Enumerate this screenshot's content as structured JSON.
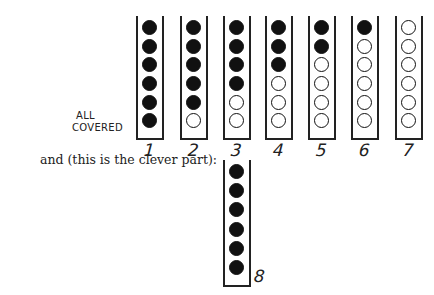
{
  "figure": {
    "annotation": [
      "ALL",
      "COVERED"
    ],
    "caption": "and (this is the clever part):",
    "columns": [
      {
        "label": "1",
        "holes": [
          "filled",
          "filled",
          "filled",
          "filled",
          "filled",
          "filled"
        ]
      },
      {
        "label": "2",
        "holes": [
          "filled",
          "filled",
          "filled",
          "filled",
          "filled",
          "empty"
        ]
      },
      {
        "label": "3",
        "holes": [
          "filled",
          "filled",
          "filled",
          "filled",
          "empty",
          "empty"
        ]
      },
      {
        "label": "4",
        "holes": [
          "filled",
          "filled",
          "filled",
          "empty",
          "empty",
          "empty"
        ]
      },
      {
        "label": "5",
        "holes": [
          "filled",
          "filled",
          "empty",
          "empty",
          "empty",
          "empty"
        ]
      },
      {
        "label": "6",
        "holes": [
          "filled",
          "empty",
          "empty",
          "empty",
          "empty",
          "empty"
        ]
      },
      {
        "label": "7",
        "holes": [
          "empty",
          "empty",
          "empty",
          "empty",
          "empty",
          "empty"
        ]
      }
    ],
    "extra_column": {
      "label": "8",
      "holes": [
        "filled",
        "filled",
        "filled",
        "filled",
        "filled",
        "filled"
      ]
    }
  }
}
